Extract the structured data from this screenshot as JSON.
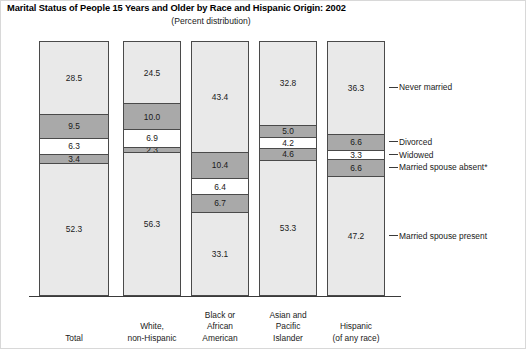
{
  "header": {
    "title": "Marital Status of People 15 Years and Older by Race and Hispanic Origin: 2002",
    "subtitle": "(Percent distribution)"
  },
  "chart_data": {
    "type": "bar",
    "stacked": true,
    "title": "Marital Status of People 15 Years and Older by Race and Hispanic Origin: 2002",
    "subtitle": "(Percent distribution)",
    "xlabel": "",
    "ylabel": "",
    "ylim": [
      0,
      100
    ],
    "grid": false,
    "legend_position": "right",
    "categories": [
      "Total",
      "White, non-Hispanic",
      "Black or African American",
      "Asian and Pacific Islander",
      "Hispanic (of any race)"
    ],
    "category_lines": [
      [
        "Total"
      ],
      [
        "White,",
        "non-Hispanic"
      ],
      [
        "Black or",
        "African",
        "American"
      ],
      [
        "Asian and",
        "Pacific",
        "Islander"
      ],
      [
        "Hispanic",
        "(of any race)"
      ]
    ],
    "series": [
      {
        "name": "Never married",
        "color": "#e9e9e9",
        "values": [
          28.5,
          24.5,
          43.4,
          32.8,
          36.3
        ]
      },
      {
        "name": "Divorced",
        "color": "#a9a9a9",
        "values": [
          9.5,
          10.0,
          10.4,
          5.0,
          6.6
        ]
      },
      {
        "name": "Widowed",
        "color": "#ffffff",
        "values": [
          6.3,
          6.9,
          6.4,
          4.2,
          3.3
        ]
      },
      {
        "name": "Married spouse absent*",
        "color": "#a9a9a9",
        "values": [
          3.4,
          2.3,
          6.7,
          4.6,
          6.6
        ]
      },
      {
        "name": "Married spouse present",
        "color": "#e9e9e9",
        "values": [
          52.3,
          56.3,
          33.1,
          53.3,
          47.2
        ]
      }
    ],
    "legend_anchor_category": "Hispanic (of any race)"
  },
  "legend": {
    "items": [
      {
        "label": "Never married"
      },
      {
        "label": "Divorced"
      },
      {
        "label": "Widowed"
      },
      {
        "label": "Married spouse absent*"
      },
      {
        "label": "Married spouse present"
      }
    ]
  }
}
